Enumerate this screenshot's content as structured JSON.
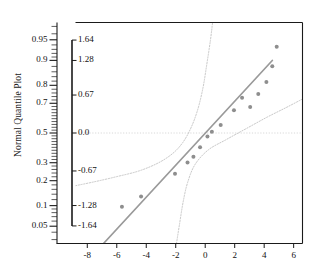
{
  "chart_data": {
    "type": "scatter",
    "title": "",
    "ylabel": "Normal Quantile Plot",
    "xlabel": "",
    "xlim": [
      -8.8,
      6.6
    ],
    "grid": false,
    "legend": null,
    "x_ticks": [
      "-8",
      "-6",
      "-4",
      "-2",
      "0",
      "2",
      "4",
      "6"
    ],
    "x_tick_values": [
      -8,
      -6,
      -4,
      -2,
      0,
      2,
      4,
      6
    ],
    "probability_axis_ticks": [
      "0.95",
      "0.9",
      "0.8",
      "0.7",
      "0.5",
      "0.3",
      "0.2",
      "0.1",
      "0.05"
    ],
    "probability_axis_values": [
      0.95,
      0.9,
      0.8,
      0.7,
      0.5,
      0.3,
      0.2,
      0.1,
      0.05
    ],
    "normal_quantile_axis_ticks": [
      "1.64",
      "1.28",
      "0.67",
      "0.0",
      "-0.67",
      "-1.28",
      "-1.64"
    ],
    "normal_quantile_axis_values": [
      1.64,
      1.28,
      0.67,
      0.0,
      -0.67,
      -1.28,
      -1.64
    ],
    "zlim": [
      -1.95,
      1.95
    ],
    "points": [
      {
        "x": -5.65,
        "z": -1.3
      },
      {
        "x": -4.35,
        "z": -1.12
      },
      {
        "x": -2.05,
        "z": -0.72
      },
      {
        "x": -1.2,
        "z": -0.52
      },
      {
        "x": -0.8,
        "z": -0.42
      },
      {
        "x": -0.35,
        "z": -0.25
      },
      {
        "x": 0.15,
        "z": -0.06
      },
      {
        "x": 0.45,
        "z": 0.02
      },
      {
        "x": 1.05,
        "z": 0.14
      },
      {
        "x": 1.95,
        "z": 0.4
      },
      {
        "x": 2.5,
        "z": 0.62
      },
      {
        "x": 3.05,
        "z": 0.46
      },
      {
        "x": 3.6,
        "z": 0.69
      },
      {
        "x": 4.15,
        "z": 0.9
      },
      {
        "x": 4.55,
        "z": 1.18
      },
      {
        "x": 4.85,
        "z": 1.52
      }
    ],
    "fit_line": {
      "x_start": -6.9,
      "z_start": -1.95,
      "x_end": 4.55,
      "z_end": 1.28
    },
    "reference_line_z": 0.0,
    "confidence_band_upper": [
      {
        "x": -8.8,
        "z": -0.93
      },
      {
        "x": -7.5,
        "z": -0.86
      },
      {
        "x": -6.0,
        "z": -0.77
      },
      {
        "x": -4.5,
        "z": -0.67
      },
      {
        "x": -3.2,
        "z": -0.53
      },
      {
        "x": -2.2,
        "z": -0.36
      },
      {
        "x": -1.5,
        "z": -0.16
      },
      {
        "x": -0.95,
        "z": 0.1
      },
      {
        "x": -0.5,
        "z": 0.42
      },
      {
        "x": -0.15,
        "z": 0.8
      },
      {
        "x": 0.1,
        "z": 1.2
      },
      {
        "x": 0.35,
        "z": 1.63
      },
      {
        "x": 0.5,
        "z": 1.95
      }
    ],
    "confidence_band_lower": [
      {
        "x": -1.95,
        "z": -1.95
      },
      {
        "x": -1.75,
        "z": -1.62
      },
      {
        "x": -1.5,
        "z": -1.22
      },
      {
        "x": -1.2,
        "z": -0.88
      },
      {
        "x": -0.7,
        "z": -0.56
      },
      {
        "x": 0.2,
        "z": -0.3
      },
      {
        "x": 1.4,
        "z": -0.12
      },
      {
        "x": 2.8,
        "z": 0.08
      },
      {
        "x": 4.2,
        "z": 0.28
      },
      {
        "x": 5.5,
        "z": 0.45
      },
      {
        "x": 6.6,
        "z": 0.6
      }
    ],
    "colors": {
      "point": "#8e8e8e",
      "fit_line": "#9a9a9a",
      "band": "#c2c2c2",
      "reference": "#d8d8d8",
      "axis": "#1a1a1a"
    }
  }
}
